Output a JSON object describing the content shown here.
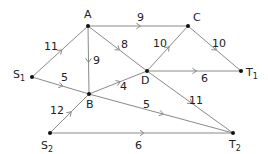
{
  "diagram": {
    "type": "directed-network",
    "nodes": [
      {
        "id": "A",
        "label": "A",
        "sub": "",
        "x": 88,
        "y": 26,
        "lx": 84,
        "ly": 18
      },
      {
        "id": "C",
        "label": "C",
        "sub": "",
        "x": 188,
        "y": 26,
        "lx": 193,
        "ly": 21
      },
      {
        "id": "D",
        "label": "D",
        "sub": "",
        "x": 147,
        "y": 71,
        "lx": 141,
        "ly": 84
      },
      {
        "id": "T1",
        "label": "T",
        "sub": "1",
        "x": 241,
        "y": 71,
        "lx": 246,
        "ly": 76
      },
      {
        "id": "S1",
        "label": "S",
        "sub": "1",
        "x": 32,
        "y": 77,
        "lx": 13,
        "ly": 78
      },
      {
        "id": "B",
        "label": "B",
        "sub": "",
        "x": 89,
        "y": 94,
        "lx": 86,
        "ly": 108
      },
      {
        "id": "S2",
        "label": "S",
        "sub": "2",
        "x": 50,
        "y": 133,
        "lx": 41,
        "ly": 149
      },
      {
        "id": "T2",
        "label": "T",
        "sub": "2",
        "x": 233,
        "y": 133,
        "lx": 229,
        "ly": 148
      }
    ],
    "edges": [
      {
        "from": "S1",
        "to": "A",
        "weight": "11",
        "lx": 44,
        "ly": 50
      },
      {
        "from": "A",
        "to": "C",
        "weight": "9",
        "lx": 137,
        "ly": 21
      },
      {
        "from": "A",
        "to": "D",
        "weight": "8",
        "lx": 121,
        "ly": 48
      },
      {
        "from": "A",
        "to": "B",
        "weight": "9",
        "lx": 93,
        "ly": 64
      },
      {
        "from": "S1",
        "to": "B",
        "weight": "5",
        "lx": 61,
        "ly": 81
      },
      {
        "from": "B",
        "to": "D",
        "weight": "4",
        "lx": 120,
        "ly": 90
      },
      {
        "from": "D",
        "to": "C",
        "weight": "10",
        "lx": 153,
        "ly": 47
      },
      {
        "from": "C",
        "to": "T1",
        "weight": "10",
        "lx": 212,
        "ly": 47
      },
      {
        "from": "D",
        "to": "T1",
        "weight": "6",
        "lx": 201,
        "ly": 82
      },
      {
        "from": "D",
        "to": "T2",
        "weight": "11",
        "lx": 189,
        "ly": 104
      },
      {
        "from": "B",
        "to": "T2",
        "weight": "5",
        "lx": 143,
        "ly": 108
      },
      {
        "from": "S2",
        "to": "B",
        "weight": "12",
        "lx": 50,
        "ly": 114
      },
      {
        "from": "S2",
        "to": "T2",
        "weight": "6",
        "lx": 135,
        "ly": 149
      }
    ],
    "colors": {
      "edge": "#8a8a8a",
      "node": "#111111",
      "text": "#222222"
    }
  }
}
